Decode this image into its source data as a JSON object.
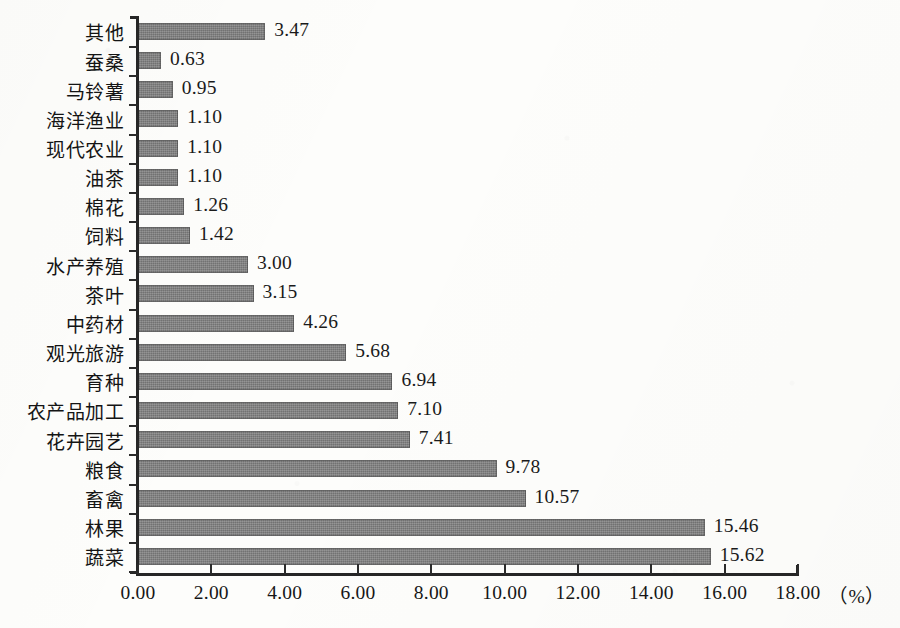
{
  "chart_data": {
    "type": "bar",
    "orientation": "horizontal",
    "title": "",
    "subtitle": "",
    "xlabel": "（%）",
    "ylabel": "",
    "xlim": [
      0.0,
      18.0
    ],
    "xticks": [
      "0.00",
      "2.00",
      "4.00",
      "6.00",
      "8.00",
      "10.00",
      "12.00",
      "14.00",
      "16.00",
      "18.00"
    ],
    "xtick_values": [
      0,
      2,
      4,
      6,
      8,
      10,
      12,
      14,
      16,
      18
    ],
    "grid": false,
    "legend": false,
    "legend_position": "none",
    "bar_color": "#7d7d7d",
    "axis_color": "#262626",
    "categories": [
      "其他",
      "蚕桑",
      "马铃薯",
      "海洋渔业",
      "现代农业",
      "油茶",
      "棉花",
      "饲料",
      "水产养殖",
      "茶叶",
      "中药材",
      "观光旅游",
      "育种",
      "农产品加工",
      "花卉园艺",
      "粮食",
      "畜禽",
      "林果",
      "蔬菜"
    ],
    "values": [
      3.47,
      0.63,
      0.95,
      1.1,
      1.1,
      1.1,
      1.26,
      1.42,
      3.0,
      3.15,
      4.26,
      5.68,
      6.94,
      7.1,
      7.41,
      9.78,
      10.57,
      15.46,
      15.62
    ],
    "value_labels": [
      "3.47",
      "0.63",
      "0.95",
      "1.10",
      "1.10",
      "1.10",
      "1.26",
      "1.42",
      "3.00",
      "3.15",
      "4.26",
      "5.68",
      "6.94",
      "7.10",
      "7.41",
      "9.78",
      "10.57",
      "15.46",
      "15.62"
    ]
  },
  "axis": {
    "unit_label": "（%）"
  }
}
